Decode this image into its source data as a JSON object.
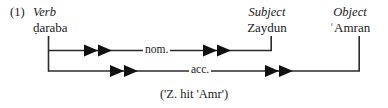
{
  "figure": {
    "example_number": "(1)",
    "columns": [
      {
        "category": "Verb",
        "form": "ḍaraba"
      },
      {
        "category": "Subject",
        "form": "Zaydun"
      },
      {
        "category": "Object",
        "form": "ʿAmran"
      }
    ],
    "relations": [
      {
        "label": "nom.",
        "from": "Verb",
        "to": "Subject"
      },
      {
        "label": "acc.",
        "from": "Verb",
        "to": "Object"
      }
    ],
    "gloss": "('Z. hit 'Amr')",
    "colors": {
      "ink": "#1a1a1a",
      "background": "#ffffff",
      "line": "#2b2b2b"
    }
  }
}
